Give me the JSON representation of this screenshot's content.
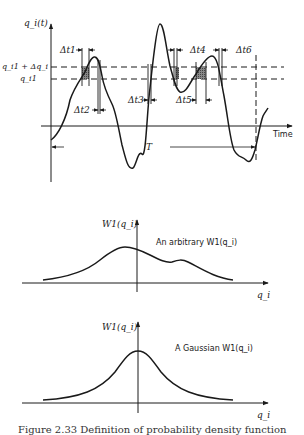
{
  "top_panel": {
    "y_axis_label": "q_i(t)",
    "x_axis_label": "Time",
    "level_upper_label": "q_i1 + Δq_i",
    "level_lower_label": "q_i1",
    "interval_labels": [
      "Δt1",
      "Δt2",
      "Δt3",
      "Δt4",
      "Δt5",
      "Δt6"
    ],
    "period_label": "T"
  },
  "middle_panel": {
    "y_axis_label": "W1(q_i)",
    "x_axis_label": "q_i",
    "annotation": "An arbitrary W1(q_i)"
  },
  "bottom_panel": {
    "y_axis_label": "W1(q_i)",
    "x_axis_label": "q_i",
    "annotation": "A Gaussian W1(q_i)"
  },
  "caption": "Figure 2.33 Definition of probability density function"
}
